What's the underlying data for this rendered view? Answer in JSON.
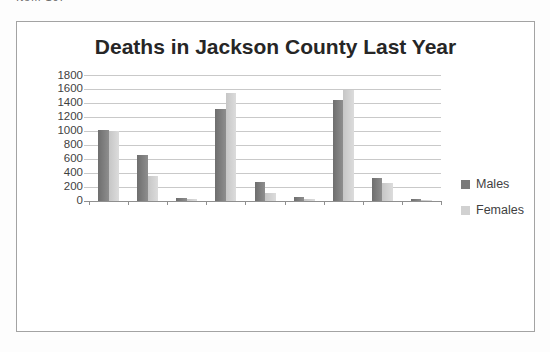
{
  "page": {
    "corner_note": "Item 10."
  },
  "colors": {
    "grid": "#c9c9c9",
    "axis": "#8f8f8f",
    "tick_text": "#3f3f3f",
    "title_text": "#262626",
    "frame_border": "#a3a3a3",
    "males_bar": "#7a7a7a",
    "females_bar": "#d1d1d1"
  },
  "chart_data": {
    "type": "bar",
    "title": "Deaths in Jackson County Last Year",
    "categories": [
      "Cancer (age 20 to 39)",
      "Diabetes (age 20 to 39)",
      "HIV (age 20 to 39)",
      "Cancer (age 40 to 59)",
      "Diabetes (age 40 to 59)",
      "HIV (age 40 to 59)",
      "Cancer (age 60 and over)",
      "Diabetes (age 60 and over)",
      "HIV (age 60 and over)"
    ],
    "series": [
      {
        "name": "Males",
        "color": "#7a7a7a",
        "color_from": "#6e6e6e",
        "color_to": "#8e8e8e",
        "values": [
          1020,
          660,
          50,
          1320,
          270,
          60,
          1450,
          330,
          30
        ]
      },
      {
        "name": "Females",
        "color": "#d1d1d1",
        "color_from": "#c6c6c6",
        "color_to": "#dcdcdc",
        "values": [
          1000,
          360,
          25,
          1550,
          120,
          25,
          1590,
          260,
          20
        ]
      }
    ],
    "xlabel": "",
    "ylabel": "",
    "ylim": [
      0,
      1800
    ],
    "yticks": [
      0,
      200,
      400,
      600,
      800,
      1000,
      1200,
      1400,
      1600,
      1800
    ],
    "grid": true,
    "legend_position": "right"
  }
}
